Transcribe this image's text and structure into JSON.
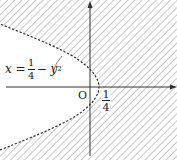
{
  "diagram": {
    "curve_equation": {
      "lhs": "x =",
      "frac_num": "1",
      "frac_den": "4",
      "rhs": "− y",
      "exp": "2"
    },
    "origin_label": "O",
    "x_intercept": {
      "num": "1",
      "den": "4"
    },
    "styles": {
      "axis_color": "#333333",
      "curve_color": "#333333",
      "hatch_color": "#9a9a9a",
      "background": "#ffffff"
    },
    "notes": {
      "curve_style": "dashed (boundary not included)",
      "shaded_region": "right of parabola (hatched)"
    }
  }
}
